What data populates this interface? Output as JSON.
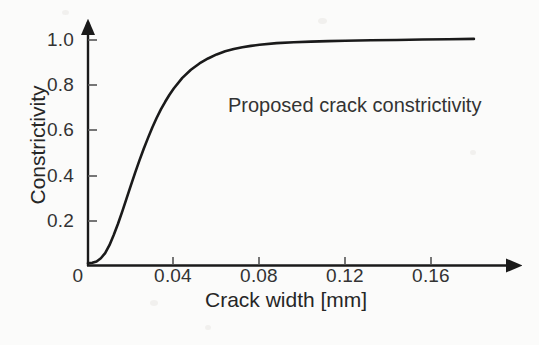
{
  "chart_data": {
    "type": "line",
    "title": "",
    "subtitle": "",
    "xlabel": "Crack width [mm]",
    "ylabel": "Constrictivity",
    "xlim": [
      0,
      0.184
    ],
    "ylim": [
      0,
      1.05
    ],
    "xticks": [
      0,
      0.04,
      0.08,
      0.12,
      0.16
    ],
    "xtick_labels": [
      "0",
      "0.04",
      "0.08",
      "0.12",
      "0.16"
    ],
    "yticks": [
      0,
      0.2,
      0.4,
      0.6,
      0.8,
      1.0
    ],
    "ytick_labels": [
      "0",
      "0.2",
      "0.4",
      "0.6",
      "0.8",
      "1.0"
    ],
    "grid": false,
    "legend": null,
    "annotations": [
      {
        "text": "Proposed crack constrictivity",
        "x": 0.065,
        "y": 0.74
      }
    ],
    "axis_arrows": true,
    "line_color": "#1a1a1a",
    "line_width": 2.6,
    "series": [
      {
        "name": "Proposed crack constrictivity",
        "x": [
          0.0,
          0.002,
          0.004,
          0.006,
          0.008,
          0.01,
          0.012,
          0.014,
          0.016,
          0.018,
          0.02,
          0.022,
          0.024,
          0.026,
          0.028,
          0.03,
          0.032,
          0.034,
          0.036,
          0.038,
          0.04,
          0.044,
          0.048,
          0.052,
          0.056,
          0.06,
          0.064,
          0.068,
          0.072,
          0.076,
          0.08,
          0.088,
          0.096,
          0.104,
          0.112,
          0.12,
          0.132,
          0.144,
          0.156,
          0.168,
          0.18
        ],
        "y": [
          0.01,
          0.012,
          0.018,
          0.032,
          0.055,
          0.09,
          0.135,
          0.185,
          0.24,
          0.298,
          0.355,
          0.412,
          0.466,
          0.518,
          0.566,
          0.612,
          0.654,
          0.692,
          0.726,
          0.757,
          0.785,
          0.832,
          0.868,
          0.896,
          0.918,
          0.936,
          0.95,
          0.96,
          0.968,
          0.974,
          0.979,
          0.986,
          0.99,
          0.993,
          0.995,
          0.997,
          0.999,
          1.0,
          1.002,
          1.003,
          1.005
        ]
      }
    ]
  },
  "axes": {
    "y_axis_name": "constrictivity-axis",
    "x_axis_name": "crack-width-axis"
  }
}
